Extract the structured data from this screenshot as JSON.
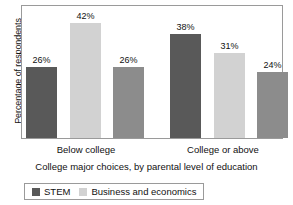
{
  "chart_data": {
    "type": "bar",
    "title": "",
    "xlabel": "College major choices, by parental level of education",
    "ylabel": "Percentage of respondents",
    "categories": [
      "Below college",
      "College or above"
    ],
    "series": [
      {
        "name": "STEM",
        "color": "#595959",
        "values": [
          26,
          38
        ],
        "labels": [
          "26%",
          "38%"
        ]
      },
      {
        "name": "Business and economics",
        "color": "#d2d2d2",
        "values": [
          42,
          31
        ],
        "labels": [
          "42%",
          "31%"
        ]
      },
      {
        "name": "",
        "color": "#8c8c8c",
        "values": [
          26,
          24
        ],
        "labels": [
          "26%",
          "24%"
        ]
      }
    ],
    "ylim": [
      0,
      48
    ],
    "grid": false,
    "legend_position": "bottom",
    "legend_entries": [
      {
        "label": "STEM",
        "color": "#595959"
      },
      {
        "label": "Business and economics",
        "color": "#d2d2d2"
      }
    ],
    "value_suffix": "%"
  }
}
